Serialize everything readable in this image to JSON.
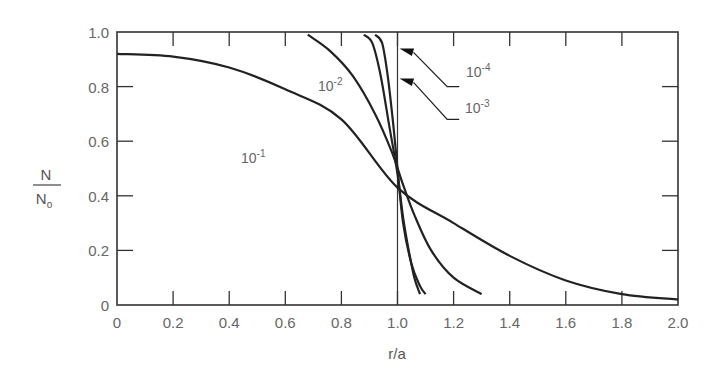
{
  "chart_data": {
    "type": "line",
    "title": "",
    "xlabel": "r/a",
    "ylabel": {
      "numerator": "N",
      "denominator": "N",
      "denominator_subscript": "o"
    },
    "xlim": [
      0,
      2.0
    ],
    "ylim": [
      0,
      1.0
    ],
    "grid": false,
    "legend": "inline labels",
    "x_ticks": [
      "0",
      "0.2",
      "0.4",
      "0.6",
      "0.8",
      "1.0",
      "1.2",
      "1.4",
      "1.6",
      "1.8",
      "2.0"
    ],
    "y_ticks": [
      "0",
      "0.2",
      "0.4",
      "0.6",
      "0.8",
      "1.0"
    ],
    "reference_line": {
      "x": 1.0,
      "orientation": "vertical"
    },
    "series": [
      {
        "name": "10^-1",
        "label_base": "10",
        "label_exp": "-1",
        "points": [
          [
            0,
            0.92
          ],
          [
            0.2,
            0.91
          ],
          [
            0.4,
            0.87
          ],
          [
            0.6,
            0.79
          ],
          [
            0.8,
            0.68
          ],
          [
            1.0,
            0.43
          ],
          [
            1.2,
            0.3
          ],
          [
            1.4,
            0.18
          ],
          [
            1.6,
            0.09
          ],
          [
            1.8,
            0.04
          ],
          [
            2.0,
            0.02
          ]
        ]
      },
      {
        "name": "10^-2",
        "label_base": "10",
        "label_exp": "-2",
        "points": [
          [
            0.68,
            0.99
          ],
          [
            0.76,
            0.93
          ],
          [
            0.84,
            0.84
          ],
          [
            0.92,
            0.7
          ],
          [
            0.98,
            0.56
          ],
          [
            1.02,
            0.44
          ],
          [
            1.06,
            0.33
          ],
          [
            1.12,
            0.2
          ],
          [
            1.2,
            0.1
          ],
          [
            1.3,
            0.04
          ]
        ]
      },
      {
        "name": "10^-3",
        "label_base": "10",
        "label_exp": "-3",
        "points": [
          [
            0.88,
            0.99
          ],
          [
            0.91,
            0.96
          ],
          [
            0.94,
            0.84
          ],
          [
            0.97,
            0.66
          ],
          [
            1.0,
            0.48
          ],
          [
            1.02,
            0.32
          ],
          [
            1.04,
            0.2
          ],
          [
            1.06,
            0.1
          ],
          [
            1.08,
            0.04
          ]
        ]
      },
      {
        "name": "10^-4",
        "label_base": "10",
        "label_exp": "-4",
        "points": [
          [
            0.92,
            0.99
          ],
          [
            0.945,
            0.96
          ],
          [
            0.965,
            0.84
          ],
          [
            0.985,
            0.66
          ],
          [
            1.0,
            0.5
          ],
          [
            1.02,
            0.3
          ],
          [
            1.05,
            0.15
          ],
          [
            1.08,
            0.07
          ],
          [
            1.1,
            0.04
          ]
        ]
      }
    ],
    "annotations": [
      {
        "text": "10^-4",
        "points_to": [
          1.0,
          0.94
        ],
        "label_at": [
          1.22,
          0.8
        ]
      },
      {
        "text": "10^-3",
        "points_to": [
          1.0,
          0.83
        ],
        "label_at": [
          1.22,
          0.68
        ]
      }
    ]
  },
  "labels": {
    "x_axis": "r/a",
    "y_num": "N",
    "y_den": "N",
    "y_den_sub": "o",
    "c1_base": "10",
    "c1_exp": "-1",
    "c2_base": "10",
    "c2_exp": "-2",
    "c3_base": "10",
    "c3_exp": "-3",
    "c4_base": "10",
    "c4_exp": "-4"
  }
}
